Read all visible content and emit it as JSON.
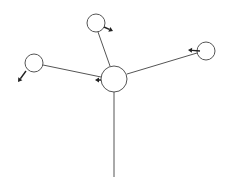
{
  "diagram": {
    "type": "free-body / star network",
    "colors": {
      "line": "#555555",
      "arrow": "#222222",
      "background": "#ffffff"
    },
    "nodes": [
      {
        "id": "center",
        "cx": 114,
        "cy": 79,
        "r": 13
      },
      {
        "id": "top",
        "cx": 96,
        "cy": 23,
        "r": 9
      },
      {
        "id": "left",
        "cx": 34,
        "cy": 63,
        "r": 9
      },
      {
        "id": "right",
        "cx": 206,
        "cy": 51,
        "r": 9
      }
    ],
    "edges": [
      {
        "from": "center",
        "to": "top",
        "x1": 110,
        "y1": 66,
        "x2": 98,
        "y2": 32
      },
      {
        "from": "center",
        "to": "left",
        "x1": 101,
        "y1": 77,
        "x2": 43,
        "y2": 65
      },
      {
        "from": "center",
        "to": "right",
        "x1": 127,
        "y1": 74,
        "x2": 197,
        "y2": 53
      },
      {
        "from": "center",
        "to": "bottom",
        "x1": 114,
        "y1": 92,
        "x2": 114,
        "y2": 177
      }
    ],
    "arrows": [
      {
        "on": "top",
        "x1": 104,
        "y1": 27,
        "x2": 113,
        "y2": 31
      },
      {
        "on": "left",
        "x1": 26,
        "y1": 71,
        "x2": 18,
        "y2": 82
      },
      {
        "on": "right",
        "x1": 200,
        "y1": 51,
        "x2": 188,
        "y2": 50
      },
      {
        "on": "center",
        "x1": 101,
        "y1": 80,
        "x2": 95,
        "y2": 80
      }
    ]
  }
}
